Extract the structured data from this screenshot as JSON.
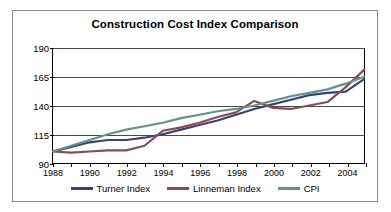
{
  "chart_data": {
    "type": "line",
    "title": "Construction Cost Index Comparison",
    "xlabel": "",
    "ylabel": "",
    "xlim": [
      1988,
      2005
    ],
    "ylim": [
      90,
      190
    ],
    "grid": true,
    "legend_position": "bottom",
    "x": [
      1988,
      1989,
      1990,
      1991,
      1992,
      1993,
      1994,
      1995,
      1996,
      1997,
      1998,
      1999,
      2000,
      2001,
      2002,
      2003,
      2004,
      2005
    ],
    "xticks": [
      1988,
      1990,
      1992,
      1994,
      1996,
      1998,
      2000,
      2002,
      2004
    ],
    "xtick_labels": [
      "1988",
      "1990",
      "1992",
      "1994",
      "1996",
      "1998",
      "2000",
      "2002",
      "2004"
    ],
    "yticks": [
      90,
      115,
      140,
      165,
      190
    ],
    "ytick_labels": [
      "90",
      "115",
      "140",
      "165",
      "190"
    ],
    "series": [
      {
        "name": "Turner Index",
        "color": "#3b3f7a",
        "values": [
          100,
          104,
          108,
          110,
          110,
          112,
          115,
          119,
          123,
          127,
          132,
          137,
          141,
          145,
          149,
          151,
          152,
          163
        ]
      },
      {
        "name": "Linneman Index",
        "color": "#8c4a55",
        "values": [
          100,
          99,
          100,
          101,
          101,
          105,
          118,
          121,
          125,
          130,
          134,
          144,
          138,
          137,
          140,
          143,
          156,
          171
        ]
      },
      {
        "name": "CPI",
        "color": "#5e9489",
        "values": [
          100,
          105,
          110,
          115,
          119,
          122,
          125,
          129,
          132,
          135,
          137,
          140,
          144,
          148,
          151,
          154,
          159,
          165
        ]
      }
    ]
  },
  "legend": {
    "items": [
      {
        "label": "Turner Index",
        "color": "#3b3f7a"
      },
      {
        "label": "Linneman Index",
        "color": "#8c4a55"
      },
      {
        "label": "CPI",
        "color": "#5e9489"
      }
    ]
  }
}
